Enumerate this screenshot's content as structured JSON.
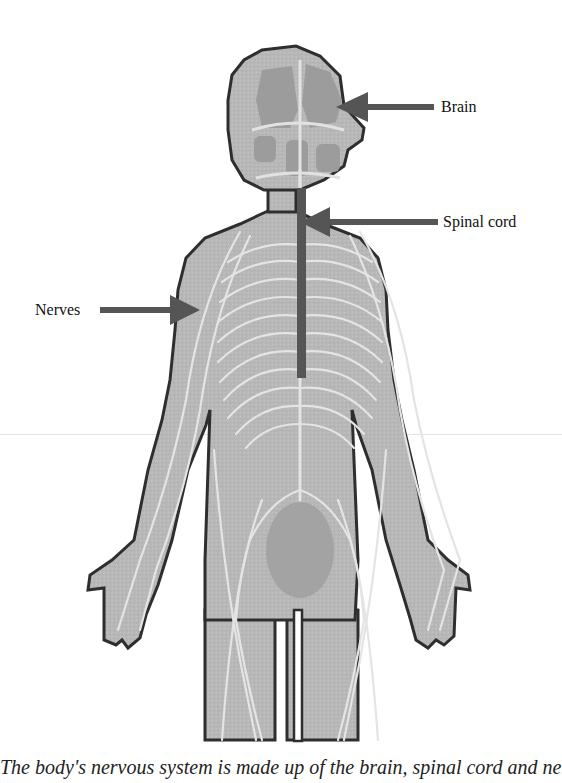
{
  "diagram": {
    "labels": [
      {
        "id": "brain",
        "text": "Brain"
      },
      {
        "id": "spinal_cord",
        "text": "Spinal cord"
      },
      {
        "id": "nerves",
        "text": "Nerves"
      }
    ],
    "colors": {
      "body_fill": "#b5b5b5",
      "organ_fill": "#9a9a9a",
      "outline": "#2e2e2e",
      "nerve_lines": "#e6e6e6",
      "arrow": "#555555",
      "spinal_cord": "#555555"
    }
  },
  "caption": {
    "text": "The body's nervous system is made up of the brain, spinal cord and nerves"
  }
}
